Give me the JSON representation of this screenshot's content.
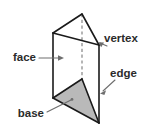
{
  "figure": {
    "shape_name": "triangular prism",
    "background_color": "#ffffff",
    "edge_color": "#1a1a1a",
    "hidden_edge_color": "#8e8e8e",
    "base_fill_color": "#b9b9b9",
    "label_color": "#2b2b2b",
    "leader_color": "#6e6e6e"
  },
  "labels": {
    "face": {
      "text": "face",
      "position": "left",
      "pointer_style": "arrow",
      "points_to": "left rectangular lateral face"
    },
    "vertex": {
      "text": "vertex",
      "position": "upper-right",
      "pointer_style": "arrow",
      "points_to": "front-right corner point of prism"
    },
    "edge": {
      "text": "edge",
      "position": "right",
      "pointer_style": "arrow",
      "points_to": "right vertical lateral edge"
    },
    "base": {
      "text": "base",
      "position": "lower-left",
      "pointer_style": "line",
      "points_to": "shaded bottom triangular base"
    }
  },
  "geometry": {
    "top_face_points": "53,33 82,14 99,45",
    "bottom_face_points": "53,98 82,79 99,123",
    "left_vertical_edge": "53,33 53,98",
    "right_vertical_edge": "99,45 99,123",
    "hidden_vertical_edge": "82,14 82,79",
    "base_triangle_points": "53,98 99,123 82,79"
  }
}
